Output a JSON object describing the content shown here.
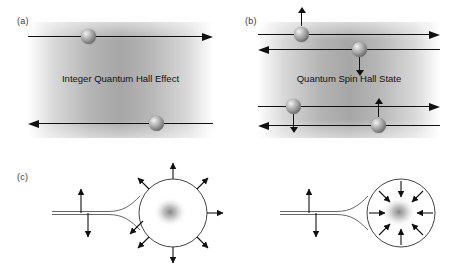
{
  "figure": {
    "type": "physics-schematic",
    "width": 455,
    "height": 273,
    "background_color": "#ffffff",
    "line_color": "#111111"
  },
  "panels": {
    "a": {
      "label": "(a)",
      "caption": "Integer Quantum Hall Effect",
      "edge_channels": [
        {
          "name": "top-edge-channel",
          "direction": "right",
          "particles": 1
        },
        {
          "name": "bottom-edge-channel",
          "direction": "left",
          "particles": 1
        }
      ],
      "particle_count": 2,
      "spin_arrows": false
    },
    "b": {
      "label": "(b)",
      "caption": "Quantum Spin Hall State",
      "edge_channels": [
        {
          "name": "top-edge-channel-right",
          "direction": "right",
          "spin": "up"
        },
        {
          "name": "top-edge-channel-left",
          "direction": "left",
          "spin": "down"
        },
        {
          "name": "bottom-edge-channel-right",
          "direction": "right",
          "spin": "down"
        },
        {
          "name": "bottom-edge-channel-left",
          "direction": "left",
          "spin": "up"
        }
      ],
      "particle_count": 4,
      "spin_arrows": true
    },
    "c": {
      "label": "(c)",
      "diagrams": [
        {
          "name": "fermi-surface-outward",
          "spin_texture": "outward",
          "arrow_count": 8,
          "has_wire": true,
          "wire_style": "double-line",
          "wire_spin_arrows": [
            "up",
            "down"
          ]
        },
        {
          "name": "fermi-surface-inward",
          "spin_texture": "inward",
          "arrow_count": 8,
          "has_wire": true,
          "wire_style": "double-line",
          "wire_spin_arrows": [
            "up",
            "down"
          ]
        }
      ]
    }
  }
}
